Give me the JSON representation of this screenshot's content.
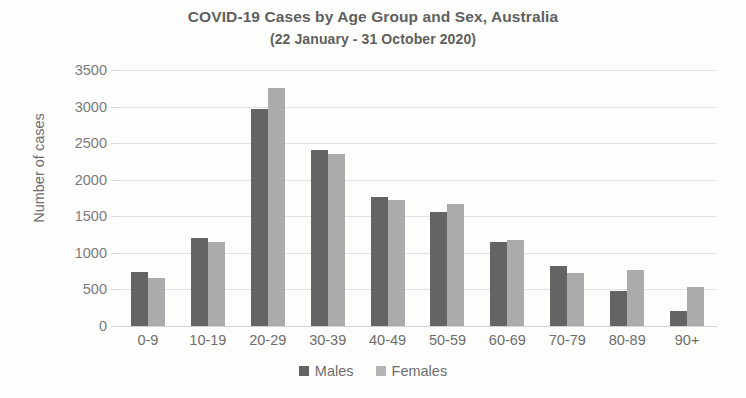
{
  "chart_data": {
    "type": "bar",
    "title": "COVID-19 Cases by Age Group and Sex, Australia",
    "subtitle": "(22 January - 31 October 2020)",
    "xlabel": "",
    "ylabel": "Number of cases",
    "ylim": [
      0,
      3500
    ],
    "ytick_step": 500,
    "yticks": [
      "3500",
      "3000",
      "2500",
      "2000",
      "1500",
      "1000",
      "500",
      "0"
    ],
    "grid": true,
    "legend_position": "bottom",
    "categories": [
      "0-9",
      "10-19",
      "20-29",
      "30-39",
      "40-49",
      "50-59",
      "60-69",
      "70-79",
      "80-89",
      "90+"
    ],
    "series": [
      {
        "name": "Males",
        "color": "#646464",
        "values": [
          745,
          1200,
          2970,
          2410,
          1770,
          1565,
          1150,
          820,
          480,
          210
        ]
      },
      {
        "name": "Females",
        "color": "#ababab",
        "values": [
          660,
          1150,
          3250,
          2355,
          1720,
          1670,
          1175,
          725,
          760,
          530
        ]
      }
    ]
  }
}
